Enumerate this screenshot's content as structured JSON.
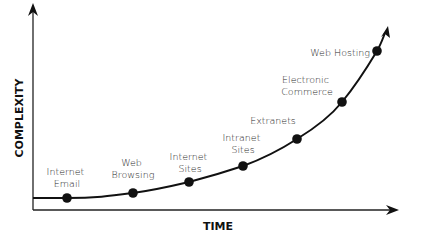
{
  "chart_data": {
    "type": "line",
    "title": "",
    "xlabel": "TIME",
    "ylabel": "COMPLEXITY",
    "grid": false,
    "legend": null,
    "x": [
      1,
      2,
      3,
      4,
      5,
      6,
      7
    ],
    "categories": [
      "Internet Email",
      "Web Browsing",
      "Internet Sites",
      "Intranet Sites",
      "Extranets",
      "Electronic Commerce",
      "Web Hosting"
    ],
    "values": [
      1,
      1.4,
      2.2,
      3.5,
      5.6,
      8.5,
      12.5
    ]
  },
  "axes": {
    "x_label": "TIME",
    "y_label": "COMPLEXITY"
  },
  "points": [
    {
      "label_lines": [
        "Internet",
        "Email"
      ],
      "x": 67,
      "y": 198
    },
    {
      "label_lines": [
        "Web",
        "Browsing"
      ],
      "x": 133,
      "y": 193
    },
    {
      "label_lines": [
        "Internet",
        "Sites"
      ],
      "x": 189,
      "y": 182
    },
    {
      "label_lines": [
        "Intranet",
        "Sites"
      ],
      "x": 243,
      "y": 166
    },
    {
      "label_lines": [
        "Extranets"
      ],
      "x": 297,
      "y": 139
    },
    {
      "label_lines": [
        "Electronic",
        "Commerce"
      ],
      "x": 342,
      "y": 102
    },
    {
      "label_lines": [
        "Web Hosting"
      ],
      "x": 377,
      "y": 51
    }
  ],
  "colors": {
    "line": "#111111",
    "text": "#2a2a2a",
    "background": "#ffffff"
  }
}
